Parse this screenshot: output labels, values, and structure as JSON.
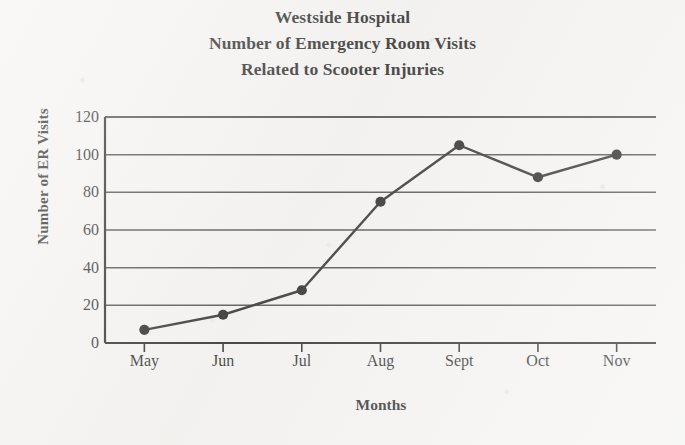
{
  "title": {
    "lines": [
      "Westside Hospital",
      "Number of Emergency Room Visits",
      "Related to Scooter Injuries"
    ]
  },
  "axes": {
    "x_title": "Months",
    "y_title": "Number of ER Visits"
  },
  "colors": {
    "ink": "#121212",
    "paper": "#f4f3f1",
    "gridline": "#3a3a3a",
    "line": "#161616",
    "marker": "#0d0d0d"
  },
  "chart_data": {
    "type": "line",
    "title": "Westside Hospital Number of Emergency Room Visits Related to Scooter Injuries",
    "xlabel": "Months",
    "ylabel": "Number of ER Visits",
    "categories": [
      "May",
      "Jun",
      "Jul",
      "Aug",
      "Sept",
      "Oct",
      "Nov"
    ],
    "values": [
      7,
      15,
      28,
      75,
      105,
      88,
      100
    ],
    "ylim": [
      0,
      120
    ],
    "yticks": [
      0,
      20,
      40,
      60,
      80,
      100,
      120
    ],
    "ytick_labels": [
      "0",
      "20",
      "40",
      "60",
      "80",
      "100",
      "120"
    ],
    "grid": true,
    "grid_axis": "y",
    "legend": false,
    "markers": "filled-circle",
    "series": [
      {
        "name": "ER Visits",
        "values": [
          7,
          15,
          28,
          75,
          105,
          88,
          100
        ]
      }
    ]
  }
}
